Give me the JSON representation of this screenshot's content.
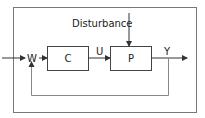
{
  "diagram": {
    "type": "feedback-control-loop",
    "labels": {
      "disturbance": "Disturbance",
      "reference": "W",
      "control_signal": "U",
      "output": "Y"
    },
    "blocks": [
      {
        "id": "controller",
        "label": "C"
      },
      {
        "id": "plant",
        "label": "P"
      }
    ],
    "colors": {
      "line": "#333333",
      "feedback_line": "#888888",
      "border": "#666666"
    }
  }
}
